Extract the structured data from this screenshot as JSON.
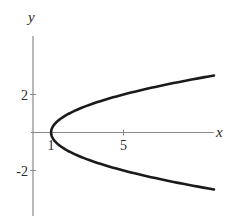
{
  "chart_data": {
    "type": "line",
    "title": "",
    "xlabel": "x",
    "ylabel": "y",
    "equation": "x = 1 + y^2",
    "x_ticks": [
      {
        "value": 1,
        "label": "1"
      },
      {
        "value": 5,
        "label": "5"
      }
    ],
    "y_ticks": [
      {
        "value": 2,
        "label": "2"
      },
      {
        "value": -2,
        "label": "-2"
      }
    ],
    "xlim": [
      -0.1,
      10
    ],
    "ylim": [
      -4.4,
      5
    ],
    "grid": false,
    "legend": null,
    "series": [
      {
        "name": "parabola",
        "color": "#1a1a1a",
        "points": [
          {
            "x": 10,
            "y": -3
          },
          {
            "x": 7.25,
            "y": -2.5
          },
          {
            "x": 5,
            "y": -2
          },
          {
            "x": 3.25,
            "y": -1.5
          },
          {
            "x": 2,
            "y": -1
          },
          {
            "x": 1.25,
            "y": -0.5
          },
          {
            "x": 1,
            "y": 0
          },
          {
            "x": 1.25,
            "y": 0.5
          },
          {
            "x": 2,
            "y": 1
          },
          {
            "x": 3.25,
            "y": 1.5
          },
          {
            "x": 5,
            "y": 2
          },
          {
            "x": 7.25,
            "y": 2.5
          },
          {
            "x": 10,
            "y": 3
          }
        ]
      }
    ]
  }
}
